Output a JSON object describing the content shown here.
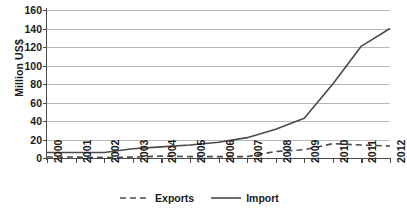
{
  "chart_data": {
    "type": "line",
    "title": "",
    "xlabel": "",
    "ylabel": "Million US$",
    "x": [
      "2000",
      "2001",
      "2002",
      "2003",
      "2004",
      "2005",
      "2006",
      "2007",
      "2008",
      "2009",
      "2010",
      "2011",
      "2012"
    ],
    "ylim": [
      0,
      160
    ],
    "yticks": [
      0,
      20,
      40,
      60,
      80,
      100,
      120,
      140,
      160
    ],
    "ytick_labels": [
      "0",
      "20",
      "40",
      "60",
      "80",
      "100",
      "120",
      "140",
      "160"
    ],
    "grid": true,
    "legend_position": "bottom-center",
    "series": [
      {
        "name": "Exports",
        "style": "dashed",
        "color": "#4a4a4a",
        "values": [
          1,
          1,
          0.5,
          1,
          2,
          1.5,
          1.5,
          1.5,
          7,
          9,
          15.5,
          14,
          13
        ]
      },
      {
        "name": "Import",
        "style": "solid",
        "color": "#4a4a4a",
        "values": [
          6,
          6,
          6,
          10,
          12,
          14,
          17,
          22,
          31,
          43,
          80,
          121,
          140
        ]
      }
    ]
  },
  "legend": {
    "entries": [
      {
        "label": "Exports",
        "swatch": "dashed-line-swatch"
      },
      {
        "label": "Import",
        "swatch": "solid-line-swatch"
      }
    ]
  }
}
